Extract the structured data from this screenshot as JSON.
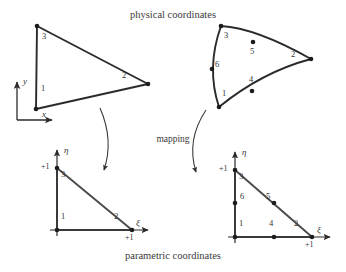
{
  "figure": {
    "title": "physical coordinates",
    "bottom_caption": "parametric coordinates",
    "mapping_label": "mapping",
    "stroke_color": "#2b2b2b",
    "text_color": "#353535"
  },
  "physical_linear_triangle": {
    "name": "3-node straight-sided triangle",
    "node_labels": [
      "1",
      "2",
      "3"
    ],
    "axes": {
      "x_label": "x",
      "y_label": "y"
    },
    "nodes": [
      {
        "id": "1",
        "x": 36,
        "y": 109,
        "label": "1",
        "label_x": 41,
        "label_y": 88
      },
      {
        "id": "2",
        "x": 148,
        "y": 84,
        "label": "2",
        "label_x": 123,
        "label_y": 74
      },
      {
        "id": "3",
        "x": 37,
        "y": 26,
        "label": "3",
        "label_x": 42,
        "label_y": 34
      }
    ]
  },
  "physical_curved_triangle": {
    "name": "6-node curved-sided triangle",
    "node_labels": [
      "1",
      "2",
      "3",
      "4",
      "5",
      "6"
    ],
    "nodes": [
      {
        "id": "1",
        "x": 219,
        "y": 107,
        "label": "1",
        "label_x": 222,
        "label_y": 93
      },
      {
        "id": "2",
        "x": 311,
        "y": 59,
        "label": "2",
        "label_x": 292,
        "label_y": 54
      },
      {
        "id": "3",
        "x": 221,
        "y": 26,
        "label": "3",
        "label_x": 224,
        "label_y": 34
      },
      {
        "id": "4",
        "x": 252,
        "y": 91,
        "label": "4",
        "label_x": 249,
        "label_y": 79
      },
      {
        "id": "5",
        "x": 253,
        "y": 42,
        "label": "5",
        "label_x": 251,
        "label_y": 51
      },
      {
        "id": "6",
        "x": 212,
        "y": 69,
        "label": "6",
        "label_x": 216,
        "label_y": 64
      }
    ]
  },
  "parametric_linear_triangle": {
    "name": "3-node reference triangle",
    "axes": {
      "xi_label": "ξ",
      "eta_label": "η"
    },
    "tick_labels": {
      "eta_one": "+1",
      "xi_one": "+1"
    },
    "nodes": [
      {
        "id": "1",
        "x": 57,
        "y": 230,
        "label": "1",
        "label_x": 61,
        "label_y": 216
      },
      {
        "id": "2",
        "x": 132,
        "y": 230,
        "label": "2",
        "label_x": 115,
        "label_y": 216
      },
      {
        "id": "3",
        "x": 57,
        "y": 168,
        "label": "3",
        "label_x": 61,
        "label_y": 173
      }
    ]
  },
  "parametric_curved_triangle": {
    "name": "6-node reference triangle",
    "axes": {
      "xi_label": "ξ",
      "eta_label": "η"
    },
    "tick_labels": {
      "eta_one": "+1",
      "xi_one": "+1"
    },
    "nodes": [
      {
        "id": "1",
        "x": 235,
        "y": 237,
        "label": "1",
        "label_x": 239,
        "label_y": 223
      },
      {
        "id": "2",
        "x": 312,
        "y": 237,
        "label": "2",
        "label_x": 295,
        "label_y": 223
      },
      {
        "id": "3",
        "x": 235,
        "y": 170,
        "label": "3",
        "label_x": 239,
        "label_y": 176
      },
      {
        "id": "4",
        "x": 274,
        "y": 237,
        "label": "4",
        "label_x": 270,
        "label_y": 223
      },
      {
        "id": "5",
        "x": 274,
        "y": 203,
        "label": "5",
        "label_x": 268,
        "label_y": 196
      },
      {
        "id": "6",
        "x": 235,
        "y": 203,
        "label": "6",
        "label_x": 240,
        "label_y": 196
      }
    ]
  }
}
